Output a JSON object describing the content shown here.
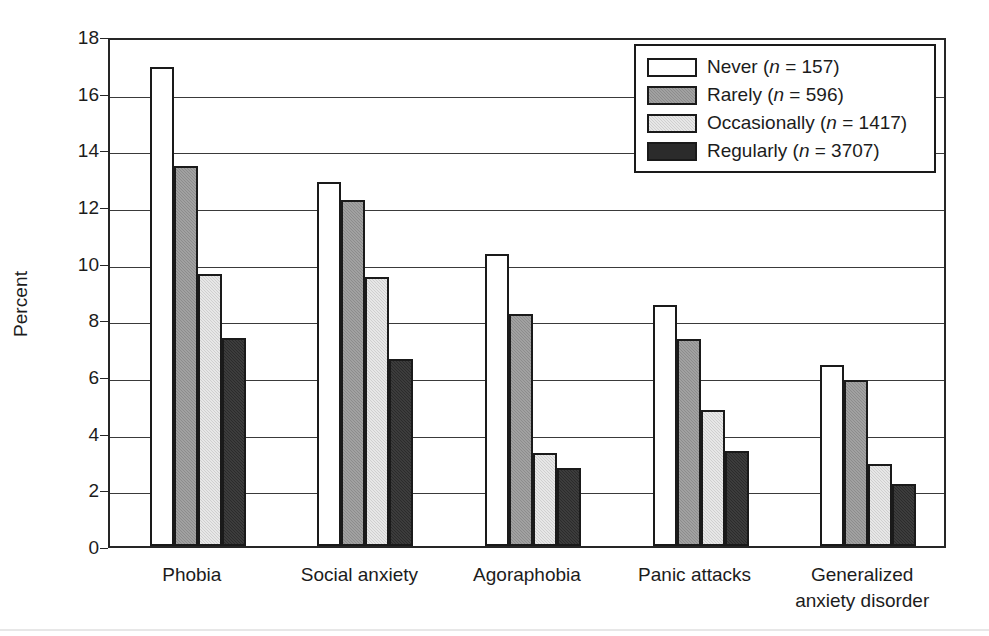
{
  "chart_data": {
    "type": "bar",
    "title": "",
    "xlabel": "",
    "ylabel": "Percent",
    "ylim": [
      0,
      18
    ],
    "ytick_step": 2,
    "yticks": [
      "18",
      "16",
      "14",
      "12",
      "10",
      "8",
      "6",
      "4",
      "2",
      "0"
    ],
    "grid": true,
    "legend_position": "top-right",
    "categories": [
      "Phobia",
      "Social anxiety",
      "Agoraphobia",
      "Panic attacks",
      "Generalized\nanxiety disorder"
    ],
    "series": [
      {
        "name": "Never",
        "legend_label": "Never (n = 157)",
        "n": 157,
        "swatch": "#ffffff",
        "values": [
          16.9,
          12.85,
          10.3,
          8.5,
          6.4
        ]
      },
      {
        "name": "Rarely",
        "legend_label": "Rarely (n = 596)",
        "n": 596,
        "swatch": "#8c8c8c",
        "values": [
          13.4,
          12.2,
          8.2,
          7.3,
          5.85
        ]
      },
      {
        "name": "Occasionally",
        "legend_label": "Occasionally (n = 1417)",
        "n": 1417,
        "swatch": "#cfcfcf",
        "values": [
          9.6,
          9.5,
          3.3,
          4.8,
          2.9
        ]
      },
      {
        "name": "Regularly",
        "legend_label": "Regularly (n = 3707)",
        "n": 3707,
        "swatch": "#2b2b2b",
        "values": [
          7.35,
          6.6,
          2.75,
          3.35,
          2.2
        ]
      }
    ]
  },
  "legend": {
    "entries": [
      {
        "label_prefix": "Never",
        "n_text": "(n = 157)"
      },
      {
        "label_prefix": "Rarely",
        "n_text": "(n = 596)"
      },
      {
        "label_prefix": "Occasionally",
        "n_text": "(n = 1417)"
      },
      {
        "label_prefix": "Regularly",
        "n_text": "(n = 3707)"
      }
    ]
  },
  "colors": {
    "axis": "#262626",
    "grid": "#3a3a3a",
    "text": "#1c1c1c",
    "bar_outline": "#1a1a1a"
  }
}
